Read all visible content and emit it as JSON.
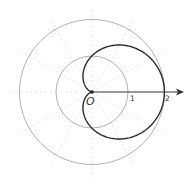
{
  "diagram": {
    "type": "polar-curve",
    "curve_equation": "r = 1 + cos(theta)",
    "curve_name": "cardioid",
    "origin_label": "O",
    "axis_labels": [
      "1",
      "2"
    ],
    "reference_circles": [
      1,
      2
    ],
    "radial_grid_step_degrees": 30,
    "colors": {
      "curve": "#2a2a2a",
      "circles": "#aaaaaa",
      "grid": "#dddddd",
      "axis": "#333333",
      "labels": "#333333"
    }
  }
}
